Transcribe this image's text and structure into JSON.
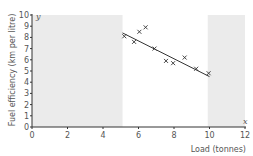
{
  "chart_data": {
    "type": "scatter",
    "title": "",
    "xlabel": "Load (tonnes)",
    "ylabel": "Fuel efficiency (km per litre)",
    "x_var": "x",
    "y_var": "y",
    "xlim": [
      0,
      12
    ],
    "ylim": [
      0,
      10
    ],
    "x_ticks": [
      0,
      2,
      4,
      6,
      8,
      10,
      12
    ],
    "y_ticks": [
      0,
      1,
      2,
      3,
      4,
      5,
      6,
      7,
      8,
      9,
      10
    ],
    "grid": false,
    "legend": null,
    "points": [
      {
        "x": 5.2,
        "y": 8.1
      },
      {
        "x": 5.75,
        "y": 7.6
      },
      {
        "x": 6.05,
        "y": 8.5
      },
      {
        "x": 6.4,
        "y": 8.9
      },
      {
        "x": 6.9,
        "y": 7.0
      },
      {
        "x": 7.55,
        "y": 5.9
      },
      {
        "x": 7.95,
        "y": 5.7
      },
      {
        "x": 8.6,
        "y": 6.2
      },
      {
        "x": 9.25,
        "y": 5.2
      },
      {
        "x": 9.95,
        "y": 4.8
      }
    ],
    "regression_line": {
      "x_start": 5.1,
      "y_start": 8.4,
      "x_end": 10.0,
      "y_end": 4.5
    },
    "shaded_regions": [
      {
        "x_from": 0,
        "x_to": 5.1,
        "y_from": 0,
        "y_to": 10,
        "meaning": "outside data range (extrapolation)"
      },
      {
        "x_from": 9.9,
        "x_to": 12,
        "y_from": 0,
        "y_to": 10,
        "meaning": "outside data range (extrapolation)"
      }
    ],
    "colors": {
      "shade": "#ebebeb",
      "axis": "#333333",
      "points": "#333333",
      "line": "#333333"
    }
  }
}
